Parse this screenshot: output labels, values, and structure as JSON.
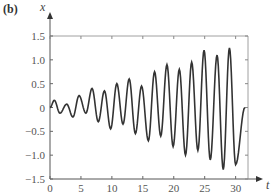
{
  "chart_data": {
    "type": "line",
    "panel_label": "(b)",
    "title": "",
    "xlabel": "t",
    "ylabel": "x",
    "xlim": [
      0,
      32
    ],
    "ylim": [
      -1.5,
      1.5
    ],
    "x_ticks": [
      "0",
      "5",
      "10",
      "15",
      "20",
      "25",
      "30"
    ],
    "y_ticks": [
      "1.5",
      "1.0",
      "0.5",
      "0",
      "-0.5",
      "-1.0",
      "-1.5"
    ],
    "grid": false,
    "series": [
      {
        "name": "x(t)",
        "color": "#333333",
        "peaks": [
          [
            0.7,
            0.15
          ],
          [
            2.7,
            0.07
          ],
          [
            4.7,
            0.25
          ],
          [
            6.8,
            0.4
          ],
          [
            8.8,
            0.35
          ],
          [
            10.8,
            0.5
          ],
          [
            12.8,
            0.6
          ],
          [
            14.8,
            0.45
          ],
          [
            16.9,
            0.75
          ],
          [
            18.9,
            0.9
          ],
          [
            20.9,
            0.8
          ],
          [
            22.9,
            0.95
          ],
          [
            24.9,
            1.2
          ],
          [
            27.0,
            1.1
          ],
          [
            29.0,
            1.25
          ]
        ],
        "troughs": [
          [
            1.6,
            -0.12
          ],
          [
            3.7,
            -0.2
          ],
          [
            5.8,
            -0.12
          ],
          [
            7.8,
            -0.3
          ],
          [
            9.8,
            -0.45
          ],
          [
            11.8,
            -0.35
          ],
          [
            13.8,
            -0.55
          ],
          [
            15.9,
            -0.7
          ],
          [
            17.9,
            -0.6
          ],
          [
            19.9,
            -0.82
          ],
          [
            21.9,
            -1.0
          ],
          [
            23.9,
            -0.9
          ],
          [
            25.9,
            -1.1
          ],
          [
            28.0,
            -1.3
          ],
          [
            30.0,
            -1.2
          ]
        ]
      }
    ]
  }
}
